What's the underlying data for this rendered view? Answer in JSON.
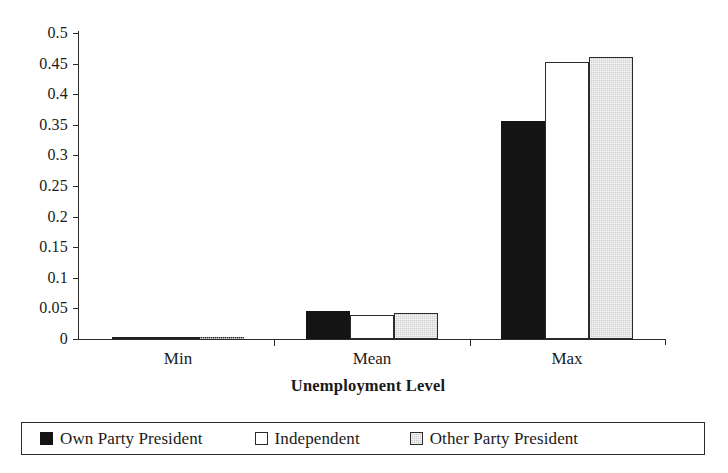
{
  "chart_data": {
    "type": "bar",
    "title": "",
    "xlabel": "Unemployment Level",
    "ylabel": "",
    "categories": [
      "Min",
      "Mean",
      "Max"
    ],
    "series": [
      {
        "name": "Own Party President",
        "color": "#141414",
        "values": [
          0.002,
          0.045,
          0.356
        ]
      },
      {
        "name": "Independent",
        "color": "#ffffff",
        "values": [
          0.002,
          0.039,
          0.452
        ]
      },
      {
        "name": "Other Party President",
        "color": "#cfcfcf",
        "values": [
          0.002,
          0.042,
          0.461
        ]
      }
    ],
    "ylim": [
      0,
      0.5
    ],
    "ytick_step": 0.05,
    "ytick_labels": [
      "0.5",
      "0.45",
      "0.4",
      "0.35",
      "0.3",
      "0.25",
      "0.2",
      "0.15",
      "0.1",
      "0.05",
      "0"
    ],
    "ytick_values": [
      0.5,
      0.45,
      0.4,
      0.35,
      0.3,
      0.25,
      0.2,
      0.15,
      0.1,
      0.05,
      0
    ],
    "grid": false,
    "legend_position": "bottom",
    "legend_border": true,
    "orientation": "vertical",
    "grouping": "clustered"
  },
  "axis": {
    "x_title": "Unemployment Level"
  },
  "legend": {
    "items": [
      {
        "label": "Own Party President",
        "swatch": "black-square-swatch"
      },
      {
        "label": "Independent",
        "swatch": "white-square-swatch"
      },
      {
        "label": "Other Party President",
        "swatch": "gray-square-swatch"
      }
    ]
  }
}
